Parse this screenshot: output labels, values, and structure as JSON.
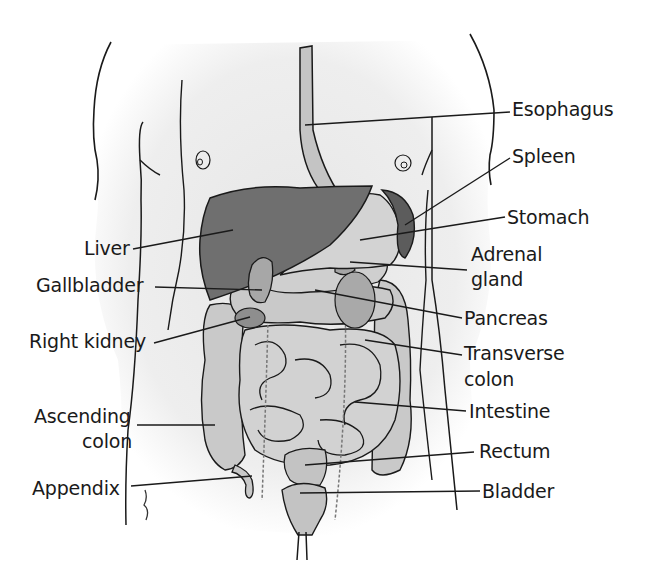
{
  "diagram": {
    "type": "anatomical-illustration",
    "colors": {
      "background": "#ffffff",
      "body_shading": "#ebebeb",
      "liver": "#6e6e6e",
      "spleen": "#5e5e5e",
      "stomach": "#cfcfcf",
      "organs_light": "#c8c8c8",
      "organs_mid": "#a9a9a9",
      "outline": "#1a1a1a",
      "leader_line": "#1a1a1a"
    },
    "labels_left": [
      {
        "text": "Liver",
        "target": "liver"
      },
      {
        "text": "Gallbladder",
        "target": "gallbladder"
      },
      {
        "text": "Right kidney",
        "target": "right-kidney"
      },
      {
        "text": "Ascending colon",
        "line1": "Ascending",
        "line2": "colon",
        "target": "ascending-colon"
      },
      {
        "text": "Appendix",
        "target": "appendix"
      }
    ],
    "labels_right": [
      {
        "text": "Esophagus",
        "target": "esophagus"
      },
      {
        "text": "Spleen",
        "target": "spleen"
      },
      {
        "text": "Stomach",
        "target": "stomach"
      },
      {
        "text": "Adrenal gland",
        "line1": "Adrenal",
        "line2": "gland",
        "target": "adrenal-gland"
      },
      {
        "text": "Pancreas",
        "target": "pancreas"
      },
      {
        "text": "Transverse colon",
        "line1": "Transverse",
        "line2": "colon",
        "target": "transverse-colon"
      },
      {
        "text": "Intestine",
        "target": "intestine"
      },
      {
        "text": "Rectum",
        "target": "rectum"
      },
      {
        "text": "Bladder",
        "target": "bladder"
      }
    ]
  }
}
